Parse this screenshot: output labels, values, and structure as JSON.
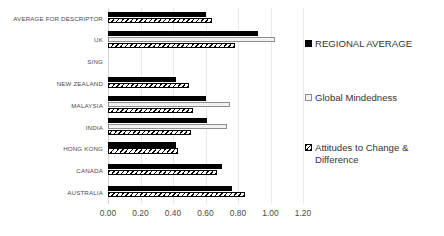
{
  "chart_data": {
    "type": "bar",
    "orientation": "horizontal",
    "title": "",
    "xlabel": "",
    "ylabel": "",
    "xlim": [
      0.0,
      1.2
    ],
    "xticks": [
      "0.00",
      "0.20",
      "0.40",
      "0.60",
      "0.80",
      "1.00",
      "1.20"
    ],
    "xtick_values": [
      0.0,
      0.2,
      0.4,
      0.6,
      0.8,
      1.0,
      1.2
    ],
    "grid": true,
    "legend_position": "right",
    "categories": [
      "AVERAGE FOR DESCRIPTOR",
      "UK",
      "SING",
      "NEW ZEALAND",
      "MALAYSIA",
      "INDIA",
      "HONG KONG",
      "CANADA",
      "AUSTRALIA"
    ],
    "series": [
      {
        "name": "REGIONAL AVERAGE",
        "color": "#000000",
        "values": [
          0.6,
          0.92,
          0.0,
          0.42,
          0.6,
          0.61,
          0.42,
          0.7,
          0.76
        ]
      },
      {
        "name": "Global Mindedness",
        "color": "#f2f2f2",
        "values": [
          0.0,
          1.03,
          0.0,
          0.0,
          0.75,
          0.73,
          0.0,
          0.0,
          0.0
        ]
      },
      {
        "name": "Attitudes to Change & Difference",
        "color": "#ffffff",
        "values": [
          0.64,
          0.78,
          0.0,
          0.5,
          0.52,
          0.51,
          0.43,
          0.67,
          0.84
        ]
      }
    ]
  },
  "legend": {
    "items": [
      {
        "label": "REGIONAL AVERAGE",
        "swatch": "regional-average-swatch"
      },
      {
        "label": "Global Mindedness",
        "swatch": "global-mindedness-swatch"
      },
      {
        "label": "Attitudes to Change & Difference",
        "swatch": "attitudes-swatch"
      }
    ]
  }
}
